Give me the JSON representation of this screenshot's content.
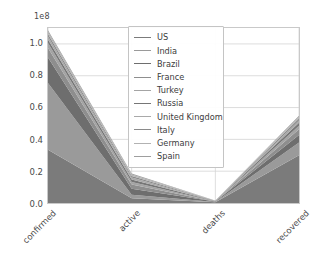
{
  "chart_data": {
    "type": "area",
    "stacked": true,
    "title": "",
    "xlabel": "",
    "ylabel": "",
    "categories": [
      "confirmed",
      "active",
      "deaths",
      "recovered"
    ],
    "y_offset_text": "1e8",
    "y_offset_value": 100000000,
    "ylim": [
      0.0,
      1.1
    ],
    "yticks": [
      "0.0",
      "0.2",
      "0.4",
      "0.6",
      "0.8",
      "1.0"
    ],
    "ytick_values": [
      0.0,
      0.2,
      0.4,
      0.6,
      0.8,
      1.0
    ],
    "grid": true,
    "legend_position": "upper center",
    "series": [
      {
        "name": "US",
        "color": "#7b7b7b",
        "values": [
          0.335,
          0.03,
          0.004,
          0.3
        ]
      },
      {
        "name": "India",
        "color": "#9a9a9a",
        "values": [
          0.42,
          0.022,
          0.002,
          0.08
        ]
      },
      {
        "name": "Brazil",
        "color": "#6e6e6e",
        "values": [
          0.16,
          0.038,
          0.003,
          0.048
        ]
      },
      {
        "name": "France",
        "color": "#8e8e8e",
        "values": [
          0.06,
          0.026,
          0.001,
          0.035
        ]
      },
      {
        "name": "Turkey",
        "color": "#a4a4a4",
        "values": [
          0.03,
          0.016,
          0.001,
          0.022
        ]
      },
      {
        "name": "Russia",
        "color": "#767676",
        "values": [
          0.022,
          0.015,
          0.001,
          0.02
        ]
      },
      {
        "name": "United Kingdom",
        "color": "#a9a9a9",
        "values": [
          0.02,
          0.013,
          0.001,
          0.014
        ]
      },
      {
        "name": "Italy",
        "color": "#8a8a8a",
        "values": [
          0.016,
          0.01,
          0.001,
          0.012
        ]
      },
      {
        "name": "Germany",
        "color": "#b2b2b2",
        "values": [
          0.013,
          0.009,
          0.001,
          0.01
        ]
      },
      {
        "name": "Spain",
        "color": "#9e9e9e",
        "values": [
          0.01,
          0.007,
          0.001,
          0.008
        ]
      }
    ],
    "totals": [
      1.086,
      0.186,
      0.016,
      0.549
    ]
  },
  "legend": {
    "items": [
      {
        "label": "US"
      },
      {
        "label": "India"
      },
      {
        "label": "Brazil"
      },
      {
        "label": "France"
      },
      {
        "label": "Turkey"
      },
      {
        "label": "Russia"
      },
      {
        "label": "United Kingdom"
      },
      {
        "label": "Italy"
      },
      {
        "label": "Germany"
      },
      {
        "label": "Spain"
      }
    ]
  }
}
